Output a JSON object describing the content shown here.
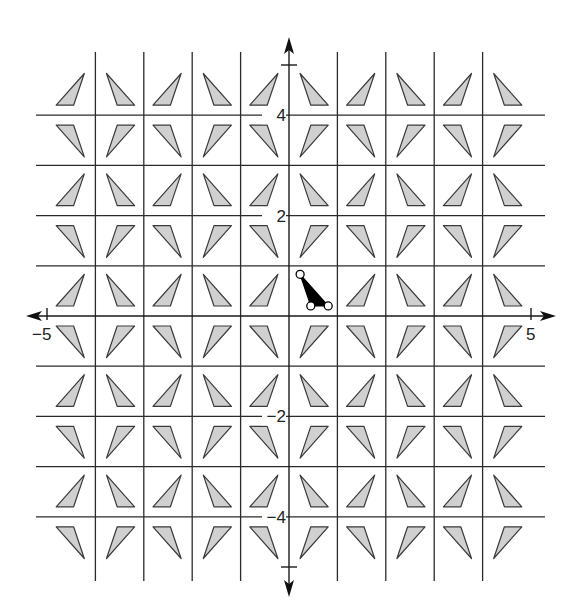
{
  "figure": {
    "type": "coordinate-plane-tessellation",
    "x_range": [
      -5,
      5
    ],
    "y_range": [
      -5,
      5
    ],
    "axis_labels": {
      "x_min": "−5",
      "x_max": "5",
      "y_ticks": [
        {
          "value": 4,
          "label": "4"
        },
        {
          "value": 2,
          "label": "2"
        },
        {
          "value": -2,
          "label": "−2"
        },
        {
          "value": -4,
          "label": "−4"
        }
      ]
    },
    "preimage_triangle": {
      "vertices": [
        [
          0.23,
          0.83
        ],
        [
          0.45,
          0.2
        ],
        [
          0.81,
          0.2
        ]
      ],
      "fill": "#000000",
      "vertex_markers": "open-circles"
    },
    "image_triangle_fill": "#d0d0d0",
    "grid_color": "#2b2b2b"
  }
}
